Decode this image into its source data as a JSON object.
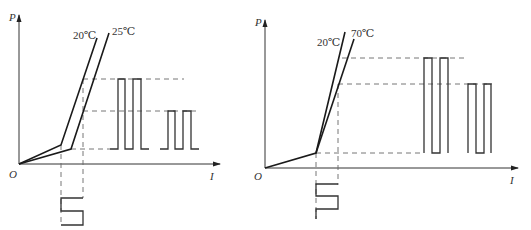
{
  "figures": [
    {
      "id": "left",
      "y_axis_label": "P",
      "x_axis_label": "I",
      "origin_label": "O",
      "curves": [
        {
          "label": "20℃",
          "meaning": "lower temperature, lower threshold"
        },
        {
          "label": "25℃",
          "meaning": "higher temperature, higher threshold"
        }
      ],
      "input_signal": "square-wave current modulation",
      "output_signals": [
        {
          "corresponds_to": "20℃",
          "relative_amplitude": "large"
        },
        {
          "corresponds_to": "25℃",
          "relative_amplitude": "small"
        }
      ]
    },
    {
      "id": "right",
      "y_axis_label": "P",
      "x_axis_label": "I",
      "origin_label": "O",
      "curves": [
        {
          "label": "20℃",
          "meaning": "steeper slope"
        },
        {
          "label": "70℃",
          "meaning": "reduced slope efficiency"
        }
      ],
      "input_signal": "square-wave current modulation",
      "output_signals": [
        {
          "corresponds_to": "20℃",
          "relative_amplitude": "large"
        },
        {
          "corresponds_to": "70℃",
          "relative_amplitude": "small"
        }
      ]
    }
  ]
}
